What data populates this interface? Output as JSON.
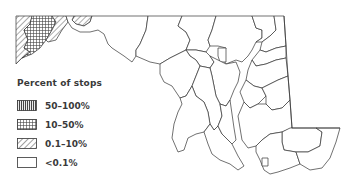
{
  "map": {
    "region": "Maryland",
    "stroke_color": "#333333",
    "background": "#ffffff"
  },
  "legend": {
    "title": "Percent of stops",
    "items": [
      {
        "label": "50–100%",
        "pattern": "vertical-lines"
      },
      {
        "label": "10–50%",
        "pattern": "grid"
      },
      {
        "label": "0.1–10%",
        "pattern": "diagonal-hatch"
      },
      {
        "label": "<0.1%",
        "pattern": "empty"
      }
    ]
  }
}
